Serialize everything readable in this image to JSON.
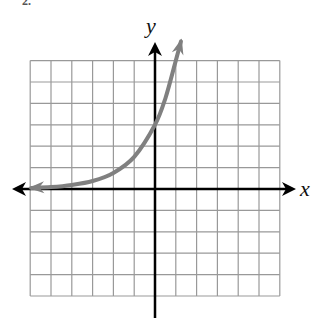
{
  "problem": {
    "number_label": "2."
  },
  "chart_data": {
    "type": "line",
    "title": "",
    "xlabel": "x",
    "ylabel": "y",
    "grid": true,
    "xlim": [
      -6,
      6
    ],
    "ylim": [
      -5,
      6
    ],
    "x_ticks_labeled": false,
    "y_ticks_labeled": false,
    "series": [
      {
        "name": "exponential growth curve",
        "description": "increasing exponential with horizontal asymptote y=0 on the left, y-intercept (0,3); approximated as y = 3·2^x — the hand-drawn curve sits above this formula on the left (measured ~1.0 at x=-2, ~0.52 at x=-3, ~0.38 at x=-4)",
        "approx_formula": "y = 3 * 2^x",
        "formula_fit_note": "points at x=0 and x=-1 match measurements; points at x<=-2 are computed from the formula, not read off the image",
        "x": [
          -5.95,
          -5,
          -4,
          -3,
          -2,
          -1,
          0,
          0.5,
          1,
          1.25
        ],
        "y": [
          0.05,
          0.09,
          0.19,
          0.375,
          0.75,
          1.5,
          3,
          4.24,
          6,
          6.9
        ],
        "color": "#808080",
        "left_arrow": true,
        "right_arrow": true
      }
    ],
    "axes": {
      "x_axis_arrows": "both",
      "y_axis_arrows": "up",
      "axis_color": "#000000",
      "grid_color": "#999999"
    }
  }
}
